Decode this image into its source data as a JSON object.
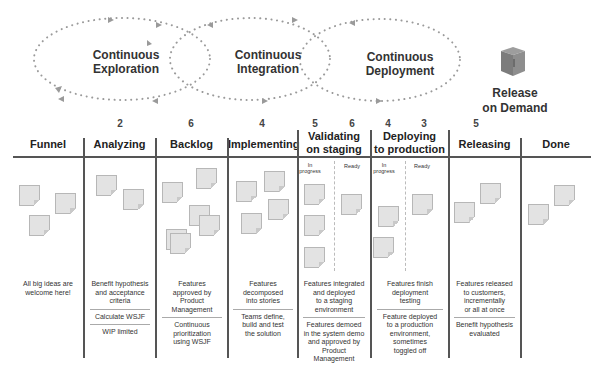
{
  "loops": [
    {
      "label": "Continuous Exploration",
      "line1": "Continuous",
      "line2": "Exploration"
    },
    {
      "label": "Continuous Integration",
      "line1": "Continuous",
      "line2": "Integration"
    },
    {
      "label": "Continuous Deployment",
      "line1": "Continuous",
      "line2": "Deployment"
    }
  ],
  "release": {
    "line1": "Release",
    "line2": "on Demand",
    "icon": "box-icon"
  },
  "columns": [
    {
      "title": "Funnel",
      "wip": "",
      "notes": 3,
      "descriptions": [
        [
          "All big ideas are",
          "welcome here!"
        ]
      ]
    },
    {
      "title": "Analyzing",
      "wip": "2",
      "notes": 2,
      "descriptions": [
        [
          "Benefit hypothesis",
          "and acceptance",
          "criteria"
        ],
        [
          "Calculate WSJF"
        ],
        [
          "WIP limited"
        ]
      ]
    },
    {
      "title": "Backlog",
      "wip": "6",
      "notes": 6,
      "descriptions": [
        [
          "Features",
          "approved by",
          "Product",
          "Management"
        ],
        [
          "Continuous",
          "prioritization",
          "using WSJF"
        ]
      ]
    },
    {
      "title": "Implementing",
      "wip": "4",
      "notes": 4,
      "descriptions": [
        [
          "Features",
          "decomposed",
          "into stories"
        ],
        [
          "Teams define,",
          "build and test",
          "the solution"
        ]
      ]
    },
    {
      "title_line1": "Validating",
      "title_line2": "on staging",
      "wip_in_progress": "5",
      "wip_ready": "6",
      "sub_in_progress": "In progress",
      "sub_ready": "Ready",
      "notes_in_progress": 3,
      "notes_ready": 1,
      "descriptions": [
        [
          "Features integrated",
          "and deployed",
          "to a staging",
          "environment"
        ],
        [
          "Features demoed",
          "in the system demo",
          "and approved by",
          "Product",
          "Management"
        ]
      ]
    },
    {
      "title_line1": "Deploying",
      "title_line2": "to production",
      "wip_in_progress": "4",
      "wip_ready": "3",
      "sub_in_progress": "In progress",
      "sub_ready": "Ready",
      "notes_in_progress": 2,
      "notes_ready": 1,
      "descriptions": [
        [
          "Features finish",
          "deployment",
          "testing"
        ],
        [
          "Feature deployed",
          "to a production",
          "environment,",
          "sometimes",
          "toggled off"
        ]
      ]
    },
    {
      "title": "Releasing",
      "wip": "5",
      "notes": 2,
      "descriptions": [
        [
          "Features released",
          "to customers,",
          "incrementally",
          "or all at once"
        ],
        [
          "Benefit hypothesis",
          "evaluated"
        ]
      ]
    },
    {
      "title": "Done",
      "wip": "",
      "notes": 2,
      "descriptions": []
    }
  ],
  "colors": {
    "line": "#555555",
    "note_fill": "#e3e3e3",
    "note_border": "#b7b7b7",
    "dots": "#9a9a9a"
  }
}
